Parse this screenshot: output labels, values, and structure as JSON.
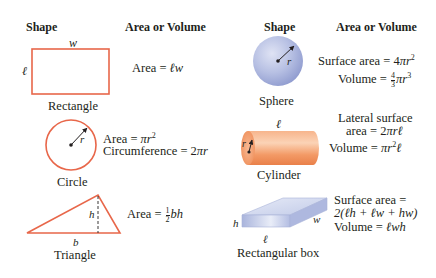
{
  "colors": {
    "outline_orange": "#e8674a",
    "sphere_blue": "#b3bde2",
    "cylinder_orange": "#f5a06e",
    "box_blue": "#c7d0ea",
    "text": "#231f20"
  },
  "left_column": {
    "header_shape": "Shape",
    "header_formula": "Area or Volume",
    "shapes": [
      {
        "name": "Rectangle",
        "dimension_labels": {
          "top": "w",
          "side": "ℓ"
        },
        "formulas": [
          "Area = ℓw"
        ]
      },
      {
        "name": "Circle",
        "dimension_labels": {
          "radius": "r"
        },
        "formulas": [
          "Area = πr²",
          "Circumference = 2πr"
        ]
      },
      {
        "name": "Triangle",
        "dimension_labels": {
          "height": "h",
          "base": "b"
        },
        "formulas": [
          "Area = ½bh"
        ]
      }
    ]
  },
  "right_column": {
    "header_shape": "Shape",
    "header_formula": "Area or Volume",
    "shapes": [
      {
        "name": "Sphere",
        "dimension_labels": {
          "radius": "r"
        },
        "formulas": [
          "Surface area = 4πr²",
          "Volume = 4/3πr³"
        ]
      },
      {
        "name": "Cylinder",
        "dimension_labels": {
          "length": "ℓ",
          "radius": "r"
        },
        "formulas": [
          "Lateral surface",
          "area = 2πrℓ",
          "Volume = πr²ℓ"
        ]
      },
      {
        "name": "Rectangular box",
        "dimension_labels": {
          "height": "h",
          "length": "ℓ",
          "width": "w"
        },
        "formulas": [
          "Surface area =",
          "2(ℓh + ℓw + hw)",
          "Volume = ℓwh"
        ]
      }
    ]
  },
  "text": {
    "eq": " = ",
    "area": "Area",
    "circumference": "Circumference",
    "surface_area": "Surface area",
    "volume": "Volume",
    "pi": "π",
    "two": "2",
    "four": "4",
    "three": "3",
    "one": "1",
    "sup2": "2",
    "sup3": "3",
    "lateral_line1": "Lateral surface",
    "lateral_area": "area",
    "box_line2": "2(ℓh + ℓw + hw)"
  }
}
